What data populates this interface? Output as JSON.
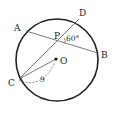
{
  "diagram": {
    "type": "circle-geometry",
    "colors": {
      "stroke": "#222222",
      "chord": "#555555",
      "background": "#ffffff"
    },
    "circle": {
      "center_label": "O",
      "cx": 57,
      "cy": 60,
      "r": 41
    },
    "points": {
      "A": {
        "label": "A",
        "x": 26,
        "y": 31
      },
      "B": {
        "label": "B",
        "x": 97,
        "y": 53
      },
      "C": {
        "label": "C",
        "x": 19,
        "y": 79
      },
      "D": {
        "label": "D",
        "x": 78,
        "y": 19
      },
      "P": {
        "label": "P",
        "x": 61,
        "y": 41
      },
      "O": {
        "label": "O",
        "x": 56,
        "y": 59
      }
    },
    "angle_label": "60°",
    "length_label": "9"
  }
}
